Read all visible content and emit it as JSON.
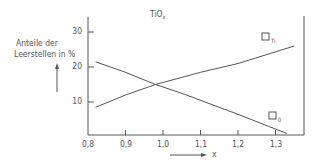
{
  "chart_data": {
    "type": "line",
    "title": "TiO",
    "title_subscript": "x",
    "xlabel": "x",
    "ylabel_line1": "Anteile der",
    "ylabel_line2": "Leerstellen in %",
    "xlim": [
      0.8,
      1.37
    ],
    "ylim": [
      0,
      34
    ],
    "grid": false,
    "x_ticks": [
      {
        "value": 0.8,
        "label": "0,8"
      },
      {
        "value": 0.9,
        "label": "0,9"
      },
      {
        "value": 1.0,
        "label": "1,0"
      },
      {
        "value": 1.1,
        "label": "1,1"
      },
      {
        "value": 1.2,
        "label": "1,2"
      },
      {
        "value": 1.3,
        "label": "1,3"
      }
    ],
    "y_ticks": [
      {
        "value": 10,
        "label": "10"
      },
      {
        "value": 20,
        "label": "20"
      },
      {
        "value": 30,
        "label": "30"
      }
    ],
    "series": [
      {
        "name": "□Ti",
        "label_box": "□",
        "label_sub": "Ti",
        "x": [
          0.82,
          0.9,
          0.98,
          1.1,
          1.2,
          1.35
        ],
        "values": [
          8.5,
          12,
          15,
          18.5,
          21,
          26
        ]
      },
      {
        "name": "□O",
        "label_box": "□",
        "label_sub": "0",
        "x": [
          0.82,
          0.9,
          0.98,
          1.05,
          1.2,
          1.33
        ],
        "values": [
          21.5,
          18.5,
          15,
          12.5,
          6.5,
          1
        ]
      }
    ],
    "line_color": "#555555"
  }
}
